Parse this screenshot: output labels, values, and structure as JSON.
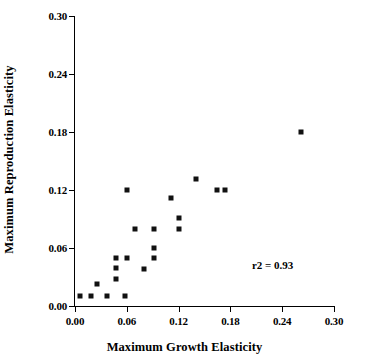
{
  "chart_data": {
    "type": "scatter",
    "title": "",
    "xlabel": "Maximum Growth Elasticity",
    "ylabel": "Maximum Reproduction Elasticity",
    "xlim": [
      0.0,
      0.3
    ],
    "ylim": [
      0.0,
      0.3
    ],
    "xticks": [
      0.0,
      0.06,
      0.12,
      0.18,
      0.24,
      0.3
    ],
    "yticks": [
      0.0,
      0.06,
      0.12,
      0.18,
      0.24,
      0.3
    ],
    "xticklabels": [
      "0.00",
      "0.06",
      "0.12",
      "0.18",
      "0.24",
      "0.30"
    ],
    "yticklabels": [
      "0.00",
      "0.06",
      "0.12",
      "0.18",
      "0.24",
      "0.30"
    ],
    "grid": false,
    "legend": null,
    "marker": "square",
    "marker_color": "#111111",
    "series": [
      {
        "name": "elasticity pairs",
        "points": [
          {
            "x": 0.006,
            "y": 0.01
          },
          {
            "x": 0.018,
            "y": 0.01
          },
          {
            "x": 0.025,
            "y": 0.023
          },
          {
            "x": 0.037,
            "y": 0.01
          },
          {
            "x": 0.058,
            "y": 0.01
          },
          {
            "x": 0.048,
            "y": 0.028
          },
          {
            "x": 0.048,
            "y": 0.039
          },
          {
            "x": 0.048,
            "y": 0.05
          },
          {
            "x": 0.06,
            "y": 0.05
          },
          {
            "x": 0.06,
            "y": 0.12
          },
          {
            "x": 0.07,
            "y": 0.08
          },
          {
            "x": 0.08,
            "y": 0.038
          },
          {
            "x": 0.091,
            "y": 0.05
          },
          {
            "x": 0.091,
            "y": 0.06
          },
          {
            "x": 0.091,
            "y": 0.08
          },
          {
            "x": 0.111,
            "y": 0.112
          },
          {
            "x": 0.12,
            "y": 0.08
          },
          {
            "x": 0.12,
            "y": 0.091
          },
          {
            "x": 0.14,
            "y": 0.131
          },
          {
            "x": 0.164,
            "y": 0.12
          },
          {
            "x": 0.174,
            "y": 0.12
          },
          {
            "x": 0.262,
            "y": 0.18
          }
        ]
      }
    ],
    "annotations": [
      {
        "text": "r2 = 0.93",
        "x": 0.205,
        "y": 0.049
      }
    ]
  }
}
